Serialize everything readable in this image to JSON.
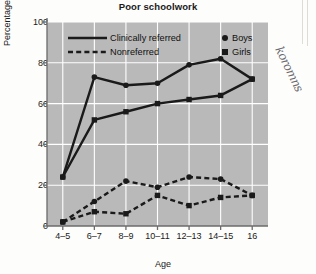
{
  "figure": {
    "title": "Poor schoolwork",
    "plot_bg": "#b9b9b9",
    "grid_color": "#ffffff",
    "line_color": "#1a1a1a",
    "axis_color": "#6b6b6b"
  },
  "annotations": {
    "handwriting": "koromns"
  },
  "legend": {
    "linestyle_entries": [
      {
        "label": "Clinically referred",
        "style": "solid"
      },
      {
        "label": "Nonreferred",
        "style": "dashed"
      }
    ],
    "marker_entries": [
      {
        "label": "Boys",
        "marker": "circle"
      },
      {
        "label": "Girls",
        "marker": "square"
      }
    ]
  },
  "chart_data": {
    "type": "line",
    "title": "Poor schoolwork",
    "xlabel": "Age",
    "ylabel": "Percentage",
    "categories": [
      "4–5",
      "6–7",
      "8–9",
      "10–11",
      "12–13",
      "14–15",
      "16"
    ],
    "ylim": [
      0,
      100
    ],
    "yticks": [
      0,
      20,
      40,
      60,
      80,
      100
    ],
    "grid": true,
    "legend_position": "upper-left-inside",
    "series": [
      {
        "name": "Clinically referred Boys",
        "group": "Clinically referred",
        "sex": "Boys",
        "style": "solid",
        "marker": "circle",
        "values": [
          24,
          73,
          69,
          70,
          79,
          82,
          72
        ]
      },
      {
        "name": "Clinically referred Girls",
        "group": "Clinically referred",
        "sex": "Girls",
        "style": "solid",
        "marker": "square",
        "values": [
          24,
          52,
          56,
          60,
          62,
          64,
          72
        ]
      },
      {
        "name": "Nonreferred Boys",
        "group": "Nonreferred",
        "sex": "Boys",
        "style": "dashed",
        "marker": "circle",
        "values": [
          2,
          12,
          22,
          19,
          24,
          23,
          15
        ]
      },
      {
        "name": "Nonreferred Girls",
        "group": "Nonreferred",
        "sex": "Girls",
        "style": "dashed",
        "marker": "square",
        "values": [
          2,
          7,
          6,
          15,
          10,
          14,
          15
        ]
      }
    ]
  }
}
